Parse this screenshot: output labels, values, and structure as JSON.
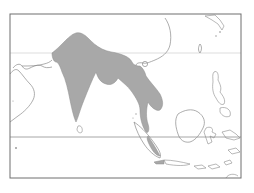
{
  "map": {
    "type": "species-range-map",
    "region": "South and Southeast Asia",
    "colors": {
      "background": "#ffffff",
      "frame": "#6e6e6e",
      "coastline": "#8a8a8a",
      "gridline": "#b4b4b4",
      "range_fill": "#a8a8a8",
      "range_stroke": "#8c8c8c"
    },
    "frame": {
      "x": 10,
      "y": 14,
      "width": 231,
      "height": 164
    },
    "gridlines": [
      {
        "name": "tropic-of-cancer",
        "y": 53
      },
      {
        "name": "equator",
        "y": 137
      }
    ],
    "legend": null,
    "labels": []
  }
}
